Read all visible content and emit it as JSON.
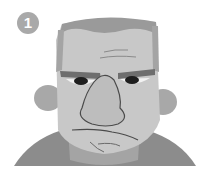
{
  "badge": {
    "number": "1"
  },
  "illustration": {
    "subject": "grumpy-man-face",
    "colors": {
      "background": "#ffffff",
      "skin": "#c8c8c8",
      "skin_shadow": "#a8a8a8",
      "hair": "#9a9a9a",
      "brow": "#6e6e6e",
      "shirt": "#8c8c8c",
      "pupil": "#1e1e1e",
      "line": "#4a4a4a",
      "badge": "#a9a9a9"
    }
  }
}
